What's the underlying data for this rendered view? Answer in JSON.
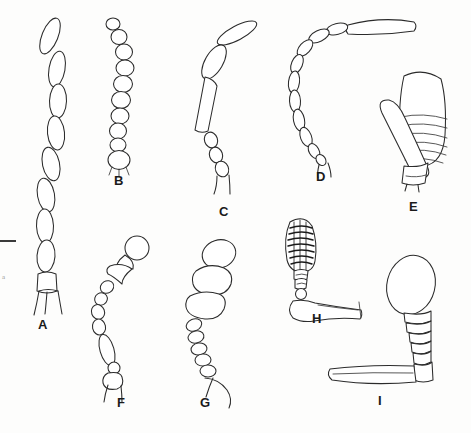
{
  "plate": {
    "background_color": "#fdfdfc",
    "ink_color": "#2b2b2b",
    "width": 471,
    "height": 433,
    "scale_bar": {
      "name": "scale-bar",
      "x": 0,
      "y": 240,
      "length": 16
    },
    "faint_mark": {
      "text": "a",
      "x": 2,
      "y": 277
    }
  },
  "figures": [
    {
      "id": "A",
      "label": "A",
      "label_x": 38,
      "label_y": 318,
      "type": "filiform",
      "description": "Filiform antenna: long chain of elongate oval flagellomeres with basal scape and pedicel",
      "segment_count": 11
    },
    {
      "id": "B",
      "label": "B",
      "label_x": 114,
      "label_y": 174,
      "type": "moniliform",
      "description": "Moniliform antenna: beadlike rounded segments in a curved chain",
      "segment_count": 11
    },
    {
      "id": "C",
      "label": "C",
      "label_x": 219,
      "label_y": 205,
      "type": "geniculate-elongate",
      "description": "Elbowed antenna with long apical flagellomere, broad pedicel and tapering basal segments",
      "segment_count": 8
    },
    {
      "id": "D",
      "label": "D",
      "label_x": 316,
      "label_y": 170,
      "type": "geniculate-filiform",
      "description": "Long arched filiform antenna with elongate scape angled at apex",
      "segment_count": 12
    },
    {
      "id": "E",
      "label": "E",
      "label_x": 409,
      "label_y": 200,
      "type": "capitate-lamellate",
      "description": "Large club with transverse annulations and a curved elongate scape lying alongside",
      "segment_count": 8
    },
    {
      "id": "F",
      "label": "F",
      "label_x": 117,
      "label_y": 400,
      "type": "aristate-serrate",
      "description": "Antenna with rounded terminal segment, angular serrate segments and slender base",
      "segment_count": 9
    },
    {
      "id": "G",
      "label": "G",
      "label_x": 200,
      "label_y": 400,
      "type": "lamellate",
      "description": "Lamellate club of three broad plates above a chain of small beadlike segments",
      "segment_count": 10
    },
    {
      "id": "H",
      "label": "H",
      "label_x": 312,
      "label_y": 314,
      "type": "plumose-club",
      "description": "Dark setose club on a short annulate stalk, small pedicel bead and broad flattened scape",
      "segment_count": 7
    },
    {
      "id": "I",
      "label": "I",
      "label_x": 378,
      "label_y": 398,
      "type": "capitate-geniculate",
      "description": "Elbowed antenna with large oval club, short funicular beads and very long straight scape",
      "segment_count": 8
    }
  ]
}
